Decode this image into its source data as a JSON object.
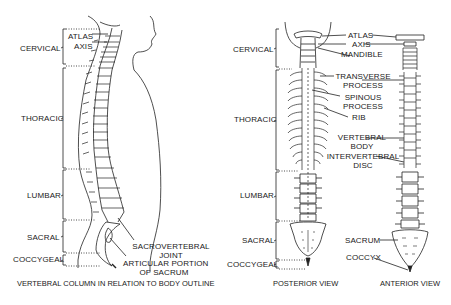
{
  "lateral_view": {
    "caption": "VERTEBRAL COLUMN IN RELATION TO BODY OUTLINE",
    "regions": [
      "CERVICAL",
      "THORACIC",
      "LUMBAR",
      "SACRAL",
      "COCCYGEAL"
    ],
    "labels": {
      "atlas": "ATLAS",
      "axis": "AXIS",
      "sacrovertebral_1": "SACROVERTEBRAL",
      "sacrovertebral_2": "JOINT",
      "articular_1": "ARTICULAR PORTION",
      "articular_2": "OF SACRUM"
    },
    "cervical_numbers": [
      "1",
      "2",
      "3",
      "4",
      "5",
      "6",
      "7"
    ]
  },
  "posterior_view": {
    "caption": "POSTERIOR VIEW",
    "regions": [
      "CERVICAL",
      "THORACIC",
      "LUMBAR",
      "SACRAL",
      "COCCYGEAL"
    ]
  },
  "center_labels": {
    "atlas": "ATLAS",
    "axis": "AXIS",
    "mandible": "MANDIBLE",
    "transverse_1": "TRANSVERSE",
    "transverse_2": "PROCESS",
    "spinous_1": "SPINOUS",
    "spinous_2": "PROCESS",
    "rib": "RIB",
    "vertebral_body_1": "VERTEBRAL",
    "vertebral_body_2": "BODY",
    "intervertebral_1": "INTERVERTEBRAL",
    "intervertebral_2": "DISC",
    "sacrum": "SACRUM",
    "coccyx": "COCCYX"
  },
  "anterior_view": {
    "caption": "ANTERIOR VIEW"
  }
}
